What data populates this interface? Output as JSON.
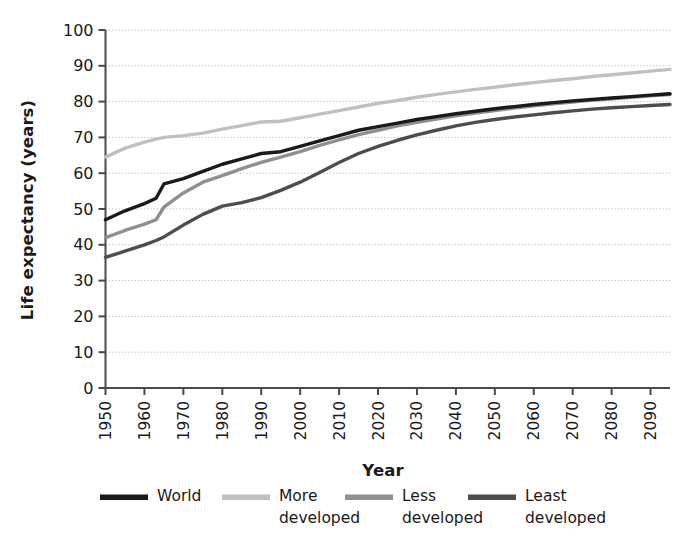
{
  "chart_data": {
    "type": "line",
    "title": "",
    "xlabel": "Year",
    "ylabel": "Life expectancy (years)",
    "xlim": [
      1950,
      2095
    ],
    "ylim": [
      0,
      100
    ],
    "grid": true,
    "grid_axis": "y",
    "legend_position": "bottom",
    "x_tick_labels": [
      "1950",
      "1960",
      "1970",
      "1980",
      "1990",
      "2000",
      "2010",
      "2020",
      "2030",
      "2040",
      "2050",
      "2060",
      "2070",
      "2080",
      "2090"
    ],
    "x_tick_values": [
      1950,
      1960,
      1970,
      1980,
      1990,
      2000,
      2010,
      2020,
      2030,
      2040,
      2050,
      2060,
      2070,
      2080,
      2090
    ],
    "y_tick_labels": [
      "0",
      "10",
      "20",
      "30",
      "40",
      "50",
      "60",
      "70",
      "80",
      "90",
      "100"
    ],
    "y_tick_values": [
      0,
      10,
      20,
      30,
      40,
      50,
      60,
      70,
      80,
      90,
      100
    ],
    "x": [
      1950,
      1955,
      1960,
      1963,
      1965,
      1970,
      1975,
      1980,
      1985,
      1990,
      1995,
      2000,
      2005,
      2010,
      2015,
      2020,
      2025,
      2030,
      2035,
      2040,
      2045,
      2050,
      2055,
      2060,
      2065,
      2070,
      2075,
      2080,
      2085,
      2090,
      2095
    ],
    "series": [
      {
        "name": "World",
        "color": "#1a1a1a",
        "values": [
          47.0,
          49.5,
          51.5,
          53.0,
          57.0,
          58.5,
          60.5,
          62.5,
          64.0,
          65.5,
          66.0,
          67.5,
          69.0,
          70.5,
          72.0,
          73.0,
          74.0,
          75.0,
          75.8,
          76.6,
          77.3,
          78.0,
          78.6,
          79.2,
          79.7,
          80.2,
          80.6,
          81.0,
          81.4,
          81.8,
          82.2
        ]
      },
      {
        "name": "More developed",
        "color": "#c0c0c0",
        "values": [
          64.5,
          67.0,
          68.7,
          69.5,
          70.0,
          70.5,
          71.2,
          72.3,
          73.3,
          74.3,
          74.5,
          75.5,
          76.5,
          77.5,
          78.5,
          79.5,
          80.3,
          81.2,
          82.0,
          82.7,
          83.4,
          84.0,
          84.7,
          85.3,
          85.9,
          86.4,
          87.0,
          87.5,
          88.0,
          88.5,
          89.0
        ]
      },
      {
        "name": "Less developed",
        "color": "#8f8f8f",
        "values": [
          42.0,
          44.0,
          45.8,
          47.0,
          50.5,
          54.5,
          57.5,
          59.3,
          61.3,
          63.0,
          64.5,
          66.0,
          67.8,
          69.3,
          70.8,
          72.0,
          73.2,
          74.2,
          75.1,
          76.0,
          76.8,
          77.5,
          78.2,
          78.8,
          79.4,
          79.9,
          80.4,
          80.8,
          81.2,
          81.6,
          82.0
        ]
      },
      {
        "name": "Least developed",
        "color": "#4d4d4d",
        "values": [
          36.5,
          38.2,
          40.0,
          41.2,
          42.2,
          45.5,
          48.5,
          50.8,
          51.8,
          53.2,
          55.2,
          57.5,
          60.2,
          63.0,
          65.5,
          67.5,
          69.2,
          70.7,
          72.0,
          73.2,
          74.2,
          75.0,
          75.7,
          76.3,
          76.9,
          77.4,
          77.9,
          78.3,
          78.6,
          78.9,
          79.2
        ]
      }
    ]
  },
  "axes": {
    "y_title": "Life expectancy (years)",
    "x_title": "Year"
  },
  "legend": {
    "items": [
      {
        "label_line1": "World",
        "label_line2": "",
        "color": "#1a1a1a"
      },
      {
        "label_line1": "More",
        "label_line2": "developed",
        "color": "#c0c0c0"
      },
      {
        "label_line1": "Less",
        "label_line2": "developed",
        "color": "#8f8f8f"
      },
      {
        "label_line1": "Least",
        "label_line2": "developed",
        "color": "#4d4d4d"
      }
    ]
  },
  "style": {
    "background": "#ffffff",
    "axis_color": "#4a4a4a",
    "grid_color": "#b8b8b8",
    "text_color": "#1a1a1a"
  }
}
